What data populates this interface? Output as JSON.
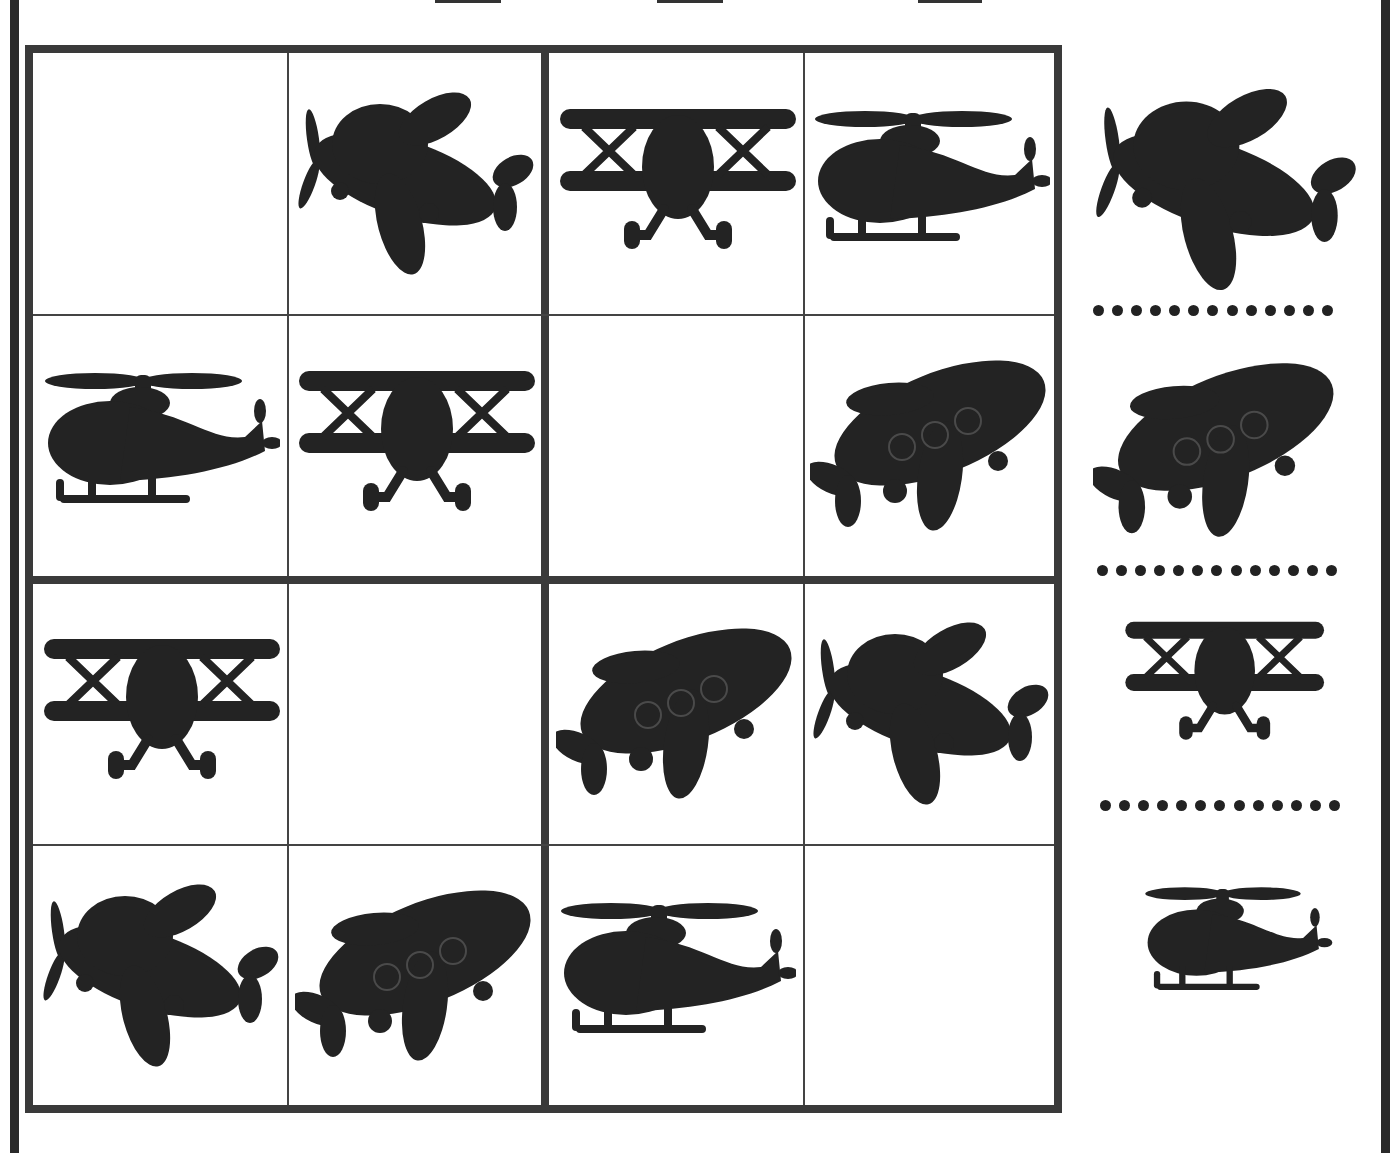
{
  "puzzle": {
    "type": "picture-sudoku-4x4",
    "grid": [
      [
        "empty",
        "propeller-plane",
        "biplane",
        "helicopter"
      ],
      [
        "helicopter",
        "biplane",
        "empty",
        "jet-plane"
      ],
      [
        "biplane",
        "empty",
        "jet-plane",
        "propeller-plane"
      ],
      [
        "propeller-plane",
        "jet-plane",
        "helicopter",
        "empty"
      ]
    ],
    "key": [
      "propeller-plane",
      "jet-plane",
      "biplane",
      "helicopter"
    ],
    "answer_dots_per_line": 13
  },
  "colors": {
    "ink": "#232323",
    "grid_line": "#3a3a3a",
    "background": "#ffffff"
  }
}
